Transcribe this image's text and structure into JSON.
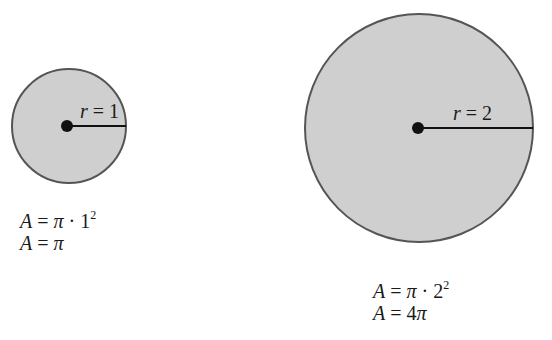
{
  "colors": {
    "fill": "#cfcfcf",
    "stroke": "#555555",
    "ink": "#111111",
    "background": "#ffffff"
  },
  "circles": [
    {
      "id": "small",
      "radius_label_var": "r",
      "radius_label_eq": " = ",
      "radius_label_val": "1",
      "formula_line1": {
        "lhs": "A",
        "eq": " = ",
        "pi": "π",
        "dot": " · ",
        "base": "1",
        "exp": "2"
      },
      "formula_line2": {
        "lhs": "A",
        "eq": " = ",
        "rhs": "π"
      }
    },
    {
      "id": "large",
      "radius_label_var": "r",
      "radius_label_eq": " = ",
      "radius_label_val": "2",
      "formula_line1": {
        "lhs": "A",
        "eq": " = ",
        "pi": "π",
        "dot": " · ",
        "base": "2",
        "exp": "2"
      },
      "formula_line2": {
        "lhs": "A",
        "eq": " = ",
        "coef": "4",
        "rhs": "π"
      }
    }
  ]
}
